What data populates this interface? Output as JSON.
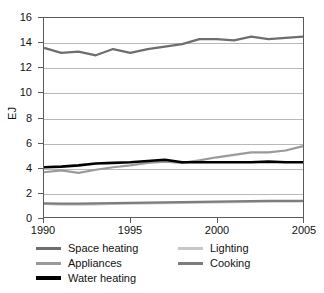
{
  "chart_data": {
    "type": "line",
    "title": "",
    "xlabel": "",
    "ylabel": "EJ",
    "xlim": [
      1990,
      2005
    ],
    "ylim": [
      0,
      16
    ],
    "grid": true,
    "grid_axis": "y",
    "legend_position": "bottom",
    "x": [
      1990,
      1991,
      1992,
      1993,
      1994,
      1995,
      1996,
      1997,
      1998,
      1999,
      2000,
      2001,
      2002,
      2003,
      2004,
      2005
    ],
    "x_ticks": [
      1990,
      1995,
      2000,
      2005
    ],
    "x_tick_labels": [
      "1990",
      "1995",
      "2000",
      "2005"
    ],
    "y_ticks": [
      0,
      2,
      4,
      6,
      8,
      10,
      12,
      14,
      16
    ],
    "y_tick_labels": [
      "0",
      "2",
      "4",
      "6",
      "8",
      "10",
      "12",
      "14",
      "16"
    ],
    "series": [
      {
        "name": "Space heating",
        "color": "#6e6e6e",
        "width": 2.2,
        "values": [
          13.6,
          13.2,
          13.3,
          13.0,
          13.5,
          13.2,
          13.5,
          13.7,
          13.9,
          14.3,
          14.3,
          14.2,
          14.5,
          14.3,
          14.4,
          14.5
        ]
      },
      {
        "name": "Lighting",
        "color": "#c8c8c8",
        "width": 2.2,
        "values": [
          1.05,
          1.0,
          1.0,
          1.02,
          1.05,
          1.07,
          1.1,
          1.12,
          1.14,
          1.16,
          1.18,
          1.2,
          1.22,
          1.23,
          1.24,
          1.25
        ]
      },
      {
        "name": "Appliances",
        "color": "#9a9a9a",
        "width": 2.2,
        "values": [
          3.6,
          3.75,
          3.55,
          3.8,
          4.0,
          4.15,
          4.35,
          4.45,
          4.35,
          4.55,
          4.8,
          5.0,
          5.2,
          5.2,
          5.35,
          5.7
        ]
      },
      {
        "name": "Cooking",
        "color": "#7d7d7d",
        "width": 2.2,
        "values": [
          1.1,
          1.08,
          1.08,
          1.1,
          1.12,
          1.14,
          1.16,
          1.18,
          1.2,
          1.22,
          1.24,
          1.26,
          1.28,
          1.29,
          1.3,
          1.3
        ]
      },
      {
        "name": "Water heating",
        "color": "#000000",
        "width": 2.6,
        "values": [
          4.0,
          4.05,
          4.15,
          4.3,
          4.35,
          4.4,
          4.5,
          4.6,
          4.4,
          4.4,
          4.4,
          4.4,
          4.4,
          4.45,
          4.4,
          4.4
        ]
      }
    ]
  },
  "axis": {
    "y_title": "EJ"
  },
  "legend": {
    "rows": [
      {
        "left": {
          "label": "Space heating",
          "color": "#6e6e6e"
        },
        "right": {
          "label": "Lighting",
          "color": "#c8c8c8"
        }
      },
      {
        "left": {
          "label": "Appliances",
          "color": "#9a9a9a"
        },
        "right": {
          "label": "Cooking",
          "color": "#7d7d7d"
        }
      },
      {
        "left": {
          "label": "Water heating",
          "color": "#000000"
        },
        "right": null
      }
    ]
  }
}
